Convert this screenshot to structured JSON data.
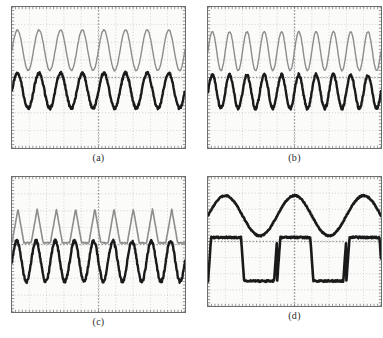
{
  "figure": {
    "type": "oscilloscope-screenshot-grid",
    "rows": 2,
    "columns": 2,
    "background_color": "#ffffff",
    "panels": [
      {
        "id": "a",
        "caption": "(a)",
        "screen": {
          "background_color": "#fbfbfa",
          "border_color": "#6d6d6d",
          "grid_divisions_x": 10,
          "grid_divisions_y": 8,
          "grid_color": "#9a9a9a",
          "grid_style": "dotted",
          "tick_marks": true
        },
        "traces": [
          {
            "name": "channel-1",
            "color": "#8d8d8d",
            "shape": "sine",
            "cycles": 8,
            "amplitude_div": 1.15,
            "offset_div": 1.55,
            "line_width": 1.4,
            "noise": 0.035
          },
          {
            "name": "channel-2",
            "color": "#1a1a1a",
            "shape": "sine",
            "cycles": 8,
            "amplitude_div": 1.0,
            "offset_div": -0.75,
            "line_width": 2.4,
            "noise": 0.08
          }
        ]
      },
      {
        "id": "b",
        "caption": "(b)",
        "screen": {
          "background_color": "#fbfbfa",
          "border_color": "#6d6d6d",
          "grid_divisions_x": 10,
          "grid_divisions_y": 8,
          "grid_color": "#9a9a9a",
          "grid_style": "dotted",
          "tick_marks": true
        },
        "traces": [
          {
            "name": "channel-1",
            "color": "#8d8d8d",
            "shape": "sine",
            "cycles": 10,
            "amplitude_div": 1.1,
            "offset_div": 1.5,
            "line_width": 1.4,
            "noise": 0.035
          },
          {
            "name": "channel-2",
            "color": "#1a1a1a",
            "shape": "sine",
            "cycles": 10,
            "amplitude_div": 0.95,
            "offset_div": -0.8,
            "line_width": 2.4,
            "noise": 0.09
          }
        ]
      },
      {
        "id": "c",
        "caption": "(c)",
        "screen": {
          "background_color": "#fbfbfa",
          "border_color": "#6d6d6d",
          "grid_divisions_x": 10,
          "grid_divisions_y": 8,
          "grid_color": "#9a9a9a",
          "grid_style": "dotted",
          "tick_marks": true
        },
        "traces": [
          {
            "name": "channel-1",
            "color": "#8d8d8d",
            "shape": "rectified-triangle",
            "cycles": 9,
            "amplitude_div": 1.0,
            "offset_div": 1.1,
            "line_width": 1.6,
            "noise": 0.03
          },
          {
            "name": "channel-2",
            "color": "#1a1a1a",
            "shape": "sine",
            "cycles": 9,
            "amplitude_div": 1.2,
            "offset_div": -1.0,
            "line_width": 2.4,
            "noise": 0.1
          }
        ]
      },
      {
        "id": "d",
        "caption": "(d)",
        "screen": {
          "background_color": "#fbfbfa",
          "border_color": "#6d6d6d",
          "grid_divisions_x": 10,
          "grid_divisions_y": 8,
          "grid_color": "#9a9a9a",
          "grid_style": "dotted",
          "tick_marks": true
        },
        "traces": [
          {
            "name": "channel-1",
            "color": "#1a1a1a",
            "shape": "sine",
            "cycles": 2.5,
            "amplitude_div": 1.25,
            "offset_div": 1.6,
            "line_width": 2.6,
            "noise": 0.04
          },
          {
            "name": "channel-2",
            "color": "#1a1a1a",
            "shape": "square",
            "cycles": 2.5,
            "amplitude_div": 1.35,
            "offset_div": -1.1,
            "line_width": 2.6,
            "noise": 0.05
          }
        ]
      }
    ]
  },
  "chart_data": {
    "type": "line",
    "title": "",
    "xlabel": "",
    "ylabel": "",
    "subplots": [
      {
        "label": "(a)",
        "xlim": [
          0,
          10
        ],
        "ylim": [
          -4,
          4
        ],
        "grid": true,
        "legend": "none",
        "series": [
          {
            "name": "upper trace (grey sine)",
            "waveform": "sine",
            "cycles_on_screen": 8,
            "amplitude_divisions": 1.15,
            "vertical_offset_divisions": 1.55
          },
          {
            "name": "lower trace (black sine)",
            "waveform": "sine",
            "cycles_on_screen": 8,
            "amplitude_divisions": 1.0,
            "vertical_offset_divisions": -0.75
          }
        ]
      },
      {
        "label": "(b)",
        "xlim": [
          0,
          10
        ],
        "ylim": [
          -4,
          4
        ],
        "grid": true,
        "legend": "none",
        "series": [
          {
            "name": "upper trace (grey sine)",
            "waveform": "sine",
            "cycles_on_screen": 10,
            "amplitude_divisions": 1.1,
            "vertical_offset_divisions": 1.5
          },
          {
            "name": "lower trace (black sine)",
            "waveform": "sine",
            "cycles_on_screen": 10,
            "amplitude_divisions": 0.95,
            "vertical_offset_divisions": -0.8
          }
        ]
      },
      {
        "label": "(c)",
        "xlim": [
          0,
          10
        ],
        "ylim": [
          -4,
          4
        ],
        "grid": true,
        "legend": "none",
        "series": [
          {
            "name": "upper trace (grey rectified triangle)",
            "waveform": "rectified-triangle",
            "cycles_on_screen": 9,
            "amplitude_divisions": 1.0,
            "vertical_offset_divisions": 1.1
          },
          {
            "name": "lower trace (black sine)",
            "waveform": "sine",
            "cycles_on_screen": 9,
            "amplitude_divisions": 1.2,
            "vertical_offset_divisions": -1.0
          }
        ]
      },
      {
        "label": "(d)",
        "xlim": [
          0,
          10
        ],
        "ylim": [
          -4,
          4
        ],
        "grid": true,
        "legend": "none",
        "series": [
          {
            "name": "upper trace (black sine)",
            "waveform": "sine",
            "cycles_on_screen": 2.5,
            "amplitude_divisions": 1.25,
            "vertical_offset_divisions": 1.6
          },
          {
            "name": "lower trace (black square)",
            "waveform": "square",
            "cycles_on_screen": 2.5,
            "amplitude_divisions": 1.35,
            "vertical_offset_divisions": -1.1
          }
        ]
      }
    ]
  }
}
